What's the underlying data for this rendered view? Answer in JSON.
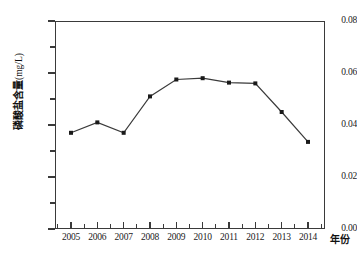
{
  "chart_data": {
    "type": "line",
    "title": "",
    "xlabel": "年份",
    "ylabel": "磷酸盐含量",
    "ylabel_unit": "(mg/L)",
    "categories": [
      "2005",
      "2006",
      "2007",
      "2008",
      "2009",
      "2010",
      "2011",
      "2012",
      "2013",
      "2014"
    ],
    "series": [
      {
        "name": "磷酸盐含量",
        "values": [
          0.037,
          0.041,
          0.037,
          0.051,
          0.0575,
          0.058,
          0.0563,
          0.056,
          0.045,
          0.0335
        ]
      }
    ],
    "ylim": [
      0.0,
      0.08
    ],
    "ytick_labels": [
      "0.00",
      "0.02",
      "0.04",
      "0.06",
      "0.08"
    ],
    "ytick_values": [
      0.0,
      0.02,
      0.04,
      0.06,
      0.08
    ],
    "yminor_values": [
      0.01,
      0.03,
      0.05,
      0.07
    ],
    "grid": false,
    "legend": "none",
    "marker": "filled-square",
    "line_color": "#3a3a3a",
    "marker_color": "#1a1a1a"
  }
}
